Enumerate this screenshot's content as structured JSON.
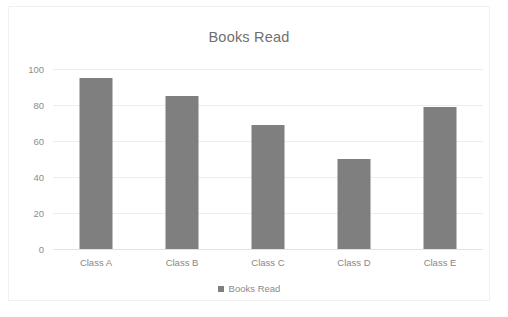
{
  "chart_data": {
    "type": "bar",
    "title": "Books Read",
    "categories": [
      "Class A",
      "Class B",
      "Class C",
      "Class D",
      "Class E"
    ],
    "values": [
      95,
      85,
      69,
      50,
      79
    ],
    "series": [
      {
        "name": "Books Read",
        "values": [
          95,
          85,
          69,
          50,
          79
        ]
      }
    ],
    "xlabel": "",
    "ylabel": "",
    "ylim": [
      0,
      100
    ],
    "y_ticks": [
      0,
      20,
      40,
      60,
      80,
      100
    ],
    "y_tick_labels": [
      "0",
      "20",
      "40",
      "60",
      "80",
      "100"
    ],
    "grid": true,
    "legend": {
      "position": "bottom",
      "entries": [
        "Books Read"
      ]
    },
    "colors": {
      "bar": "#7f7f7f",
      "grid": "#ededed",
      "text": "#8d8d8d",
      "title": "#6f6f6f",
      "background": "#ffffff",
      "frame": "#f1f1f1"
    }
  }
}
